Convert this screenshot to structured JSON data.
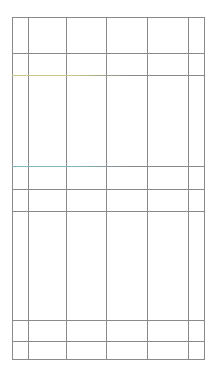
{
  "table": {
    "title": "",
    "columns_x": [
      12,
      28,
      66,
      106,
      147,
      188,
      204
    ],
    "rows_y": [
      17,
      53,
      75,
      166,
      189,
      211,
      320,
      341,
      359
    ],
    "line_color": "#8a8a8a",
    "accent_lines": [
      {
        "y": 75,
        "color": "#c9c98a"
      },
      {
        "y": 166,
        "color": "#7fb8c4"
      }
    ],
    "cells": []
  }
}
